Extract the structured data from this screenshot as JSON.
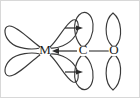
{
  "figure": {
    "name": "metal-carbonyl-synergic-bonding-diagram",
    "background_color": "#ffffff",
    "stroke_color": "#3a3a3a",
    "label_color": "#1a1a1a"
  },
  "atoms": [
    {
      "id": "metal",
      "label": "M",
      "x": 45,
      "y": 51
    },
    {
      "id": "carbon",
      "label": "C",
      "x": 83,
      "y": 51
    },
    {
      "id": "oxygen",
      "label": "O",
      "x": 114,
      "y": 51
    }
  ],
  "bonds": [
    {
      "id": "sigma-donation",
      "from": "carbon",
      "to": "metal",
      "style": "arrow",
      "direction": "right-to-left",
      "description": "sigma donation from carbon lone pair to metal"
    },
    {
      "id": "c-o-bond",
      "from": "carbon",
      "to": "oxygen",
      "style": "line",
      "direction": "none",
      "description": "carbon oxygen bond"
    }
  ],
  "backbonding_arrows": [
    {
      "id": "pi-backbond-upper",
      "direction": "left-to-right",
      "description": "pi backbonding from metal d orbital into CO pi* upper lobe"
    },
    {
      "id": "pi-backbond-lower",
      "direction": "left-to-right",
      "description": "pi backbonding from metal d orbital into CO pi* lower lobe"
    }
  ],
  "orbitals": [
    {
      "id": "metal-lobe-upper-left",
      "owner": "metal",
      "orientation": "upper-left",
      "shape": "teardrop"
    },
    {
      "id": "metal-lobe-lower-left",
      "owner": "metal",
      "orientation": "lower-left",
      "shape": "teardrop"
    },
    {
      "id": "metal-lobe-upper-right",
      "owner": "metal",
      "orientation": "upper-right",
      "shape": "teardrop"
    },
    {
      "id": "metal-lobe-lower-right",
      "owner": "metal",
      "orientation": "lower-right",
      "shape": "teardrop"
    },
    {
      "id": "carbon-p-lobe-upper",
      "owner": "carbon",
      "orientation": "up",
      "shape": "teardrop"
    },
    {
      "id": "carbon-p-lobe-lower",
      "owner": "carbon",
      "orientation": "down",
      "shape": "teardrop"
    },
    {
      "id": "oxygen-p-lobe-upper",
      "owner": "oxygen",
      "orientation": "up",
      "shape": "teardrop"
    },
    {
      "id": "oxygen-p-lobe-lower",
      "owner": "oxygen",
      "orientation": "down",
      "shape": "teardrop"
    }
  ]
}
